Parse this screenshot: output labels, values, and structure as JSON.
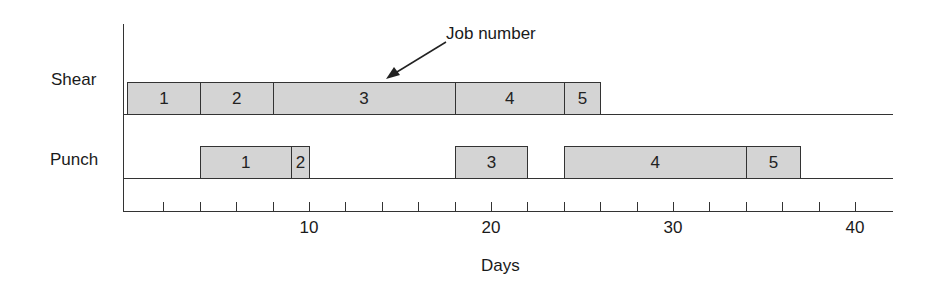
{
  "chart_data": {
    "type": "gantt",
    "title": "",
    "xlabel": "Days",
    "ylabel": "",
    "xlim": [
      0,
      42
    ],
    "grid": false,
    "annotation": "Job number",
    "x_ticks_major": [
      10,
      20,
      30,
      40
    ],
    "x_tick_minor_step": 2,
    "rows": [
      {
        "name": "Shear",
        "jobs": [
          {
            "job": "1",
            "start": 0,
            "end": 4
          },
          {
            "job": "2",
            "start": 4,
            "end": 8
          },
          {
            "job": "3",
            "start": 8,
            "end": 18
          },
          {
            "job": "4",
            "start": 18,
            "end": 24
          },
          {
            "job": "5",
            "start": 24,
            "end": 26
          }
        ]
      },
      {
        "name": "Punch",
        "jobs": [
          {
            "job": "1",
            "start": 4,
            "end": 9
          },
          {
            "job": "2",
            "start": 9,
            "end": 10
          },
          {
            "job": "3",
            "start": 18,
            "end": 22
          },
          {
            "job": "4",
            "start": 24,
            "end": 34
          },
          {
            "job": "5",
            "start": 34,
            "end": 37
          }
        ]
      }
    ]
  },
  "colors": {
    "bar_fill": "#d4d4d4",
    "line": "#333333"
  }
}
